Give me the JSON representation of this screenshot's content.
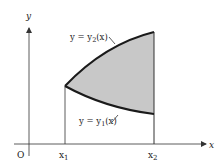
{
  "diagram": {
    "type": "area-between-curves",
    "axes": {
      "x_label": "x",
      "y_label": "y",
      "origin_label": "O"
    },
    "bounds": {
      "left_label": "x",
      "left_sub": "1",
      "right_label": "x",
      "right_sub": "2"
    },
    "curves": {
      "upper": {
        "prefix": "y = y",
        "sub": "2",
        "suffix": "(x)"
      },
      "lower": {
        "prefix": "y = y",
        "sub": "1",
        "suffix": "(x)"
      }
    },
    "colors": {
      "fill": "#c8c8c8",
      "stroke": "#1a1a1a",
      "axis": "#333333"
    }
  }
}
